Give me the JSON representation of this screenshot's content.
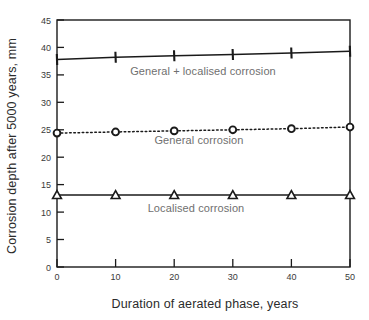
{
  "chart_data": {
    "type": "line",
    "title": "",
    "xlabel": "Duration of aerated phase, years",
    "ylabel": "Corrosion depth after 5000 years, mm",
    "xlim": [
      0,
      50
    ],
    "ylim": [
      0,
      45
    ],
    "xticks": [
      0,
      10,
      20,
      30,
      40,
      50
    ],
    "yticks": [
      0,
      5,
      10,
      15,
      20,
      25,
      30,
      35,
      40,
      45
    ],
    "xtick_labels": [
      "0",
      "10",
      "20",
      "30",
      "40",
      "50"
    ],
    "ytick_labels": [
      "0",
      "5",
      "10",
      "15",
      "20",
      "25",
      "30",
      "35",
      "40",
      "45"
    ],
    "grid": false,
    "frame": "box",
    "legend": "inline-annotations",
    "x": [
      0,
      10,
      20,
      30,
      40,
      50
    ],
    "series": [
      {
        "name": "General + localised corrosion",
        "values": [
          37.8,
          38.2,
          38.5,
          38.7,
          39.0,
          39.3
        ],
        "marker": "plus",
        "linestyle": "solid",
        "color": "#1a1a1a",
        "annotation": "General + localised corrosion"
      },
      {
        "name": "General corrosion",
        "values": [
          24.4,
          24.6,
          24.8,
          25.0,
          25.2,
          25.5
        ],
        "marker": "circle",
        "linestyle": "dotted",
        "color": "#1a1a1a",
        "annotation": "General corrosion"
      },
      {
        "name": "Localised corrosion",
        "values": [
          13.1,
          13.1,
          13.1,
          13.1,
          13.1,
          13.1
        ],
        "marker": "triangle",
        "linestyle": "solid",
        "color": "#1a1a1a",
        "annotation": "Localised corrosion"
      }
    ]
  },
  "axis": {
    "x_title": "Duration of aerated phase, years",
    "y_title": "Corrosion depth after 5000 years, mm"
  },
  "annotations": {
    "top": "General + localised corrosion",
    "middle": "General corrosion",
    "bottom": "Localised corrosion"
  },
  "ticks": {
    "y": [
      "45",
      "40",
      "35",
      "30",
      "25",
      "20",
      "15",
      "10",
      "5",
      "0"
    ],
    "x": [
      "0",
      "10",
      "20",
      "30",
      "40",
      "50"
    ]
  }
}
